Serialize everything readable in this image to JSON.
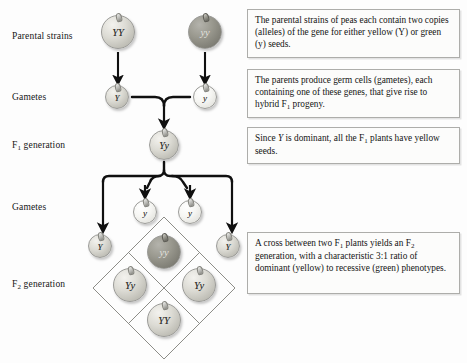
{
  "figure": {
    "width": 467,
    "height": 363,
    "background_color": "#fdfdfd"
  },
  "row_labels": [
    {
      "id": "parental-strains",
      "text": "Parental strains",
      "x": 12,
      "y": 31
    },
    {
      "id": "gametes-1",
      "text": "Gametes",
      "x": 12,
      "y": 92
    },
    {
      "id": "f1-generation",
      "text": "F1 generation",
      "base": "F",
      "sub": "1",
      "rest": " generation",
      "x": 12,
      "y": 140
    },
    {
      "id": "gametes-2",
      "text": "Gametes",
      "x": 12,
      "y": 202
    },
    {
      "id": "f2-generation",
      "text": "F2 generation",
      "base": "F",
      "sub": "2",
      "rest": " generation",
      "x": 12,
      "y": 279
    }
  ],
  "peas": {
    "parent_left": {
      "genotype": "YY",
      "shade": "light",
      "cx": 118,
      "cy": 32,
      "r": 17
    },
    "parent_right": {
      "genotype": "yy",
      "shade": "dark",
      "cx": 205,
      "cy": 32,
      "r": 17
    },
    "gamete_p_left": {
      "genotype": "Y",
      "shade": "light",
      "cx": 117,
      "cy": 97,
      "r": 12
    },
    "gamete_p_right": {
      "genotype": "y",
      "shade": "pale",
      "cx": 205,
      "cy": 97,
      "r": 12
    },
    "f1": {
      "genotype": "Yy",
      "shade": "light",
      "cx": 164,
      "cy": 145,
      "r": 15
    },
    "gamete_f1_a": {
      "genotype": "y",
      "shade": "pale",
      "cx": 145,
      "cy": 212,
      "r": 12
    },
    "gamete_f1_b": {
      "genotype": "y",
      "shade": "pale",
      "cx": 190,
      "cy": 212,
      "r": 12
    },
    "gamete_f1_left": {
      "genotype": "Y",
      "shade": "light",
      "cx": 100,
      "cy": 246,
      "r": 12
    },
    "gamete_f1_right": {
      "genotype": "Y",
      "shade": "light",
      "cx": 228,
      "cy": 246,
      "r": 12
    },
    "f2_top": {
      "genotype": "yy",
      "shade": "dark",
      "cx": 164,
      "cy": 252,
      "r": 17
    },
    "f2_left": {
      "genotype": "Yy",
      "shade": "light",
      "cx": 130,
      "cy": 285,
      "r": 17
    },
    "f2_right": {
      "genotype": "Yy",
      "shade": "light",
      "cx": 199,
      "cy": 285,
      "r": 17
    },
    "f2_bottom": {
      "genotype": "YY",
      "shade": "light",
      "cx": 164,
      "cy": 320,
      "r": 17
    }
  },
  "punnett_square": {
    "center_x": 164,
    "center_y": 288,
    "half_diagonal": 71,
    "stroke_color": "#8d8d88",
    "cells": [
      {
        "position": "top",
        "genotype": "yy",
        "phenotype": "green"
      },
      {
        "position": "left",
        "genotype": "Yy",
        "phenotype": "yellow"
      },
      {
        "position": "right",
        "genotype": "Yy",
        "phenotype": "yellow"
      },
      {
        "position": "bottom",
        "genotype": "YY",
        "phenotype": "yellow"
      }
    ]
  },
  "callouts": [
    {
      "id": "callout-parental",
      "x": 247,
      "y": 9,
      "width": 213,
      "height": 49,
      "lines": [
        "The parental strains of peas each contain",
        "two copies (alleles) of the gene for either",
        "yellow (Y) or green (y) seeds."
      ],
      "text": "The parental strains of peas each contain two copies (alleles) of the gene for either yellow (Y) or green (y) seeds."
    },
    {
      "id": "callout-gametes",
      "x": 247,
      "y": 69,
      "width": 213,
      "height": 49,
      "lines": [
        "The parents produce germ cells (gametes),",
        "each containing one of these genes, that",
        "give rise to hybrid F1 progeny."
      ],
      "text": "The parents produce germ cells (gametes), each containing one of these genes, that give rise to hybrid F1 progeny."
    },
    {
      "id": "callout-dominant",
      "x": 247,
      "y": 127,
      "width": 213,
      "height": 37,
      "lines": [
        "Since Y is dominant, all the F1 plants have",
        "yellow seeds."
      ],
      "text": "Since Y is dominant, all the F1 plants have yellow seeds."
    },
    {
      "id": "callout-f2-cross",
      "x": 247,
      "y": 232,
      "width": 213,
      "height": 62,
      "lines": [
        "A cross between two F1 plants yields an",
        "F2 generation, with a characteristic",
        "3:1 ratio of dominant (yellow) to recessive",
        "(green) phenotypes."
      ],
      "text": "A cross between two F1 plants yields an F2 generation, with a characteristic 3:1 ratio of dominant (yellow) to recessive (green) phenotypes."
    }
  ],
  "colors": {
    "arrow": "#101010",
    "box_border": "#adadaa",
    "box_fill": "#fcfcfb",
    "text": "#141414",
    "punnett_line": "#8d8d88",
    "pea_light": "#dcdbd4",
    "pea_dark": "#8a8980",
    "pea_pale": "#f6f6f3"
  },
  "ratio_note": "3:1 dominant (yellow) to recessive (green)"
}
